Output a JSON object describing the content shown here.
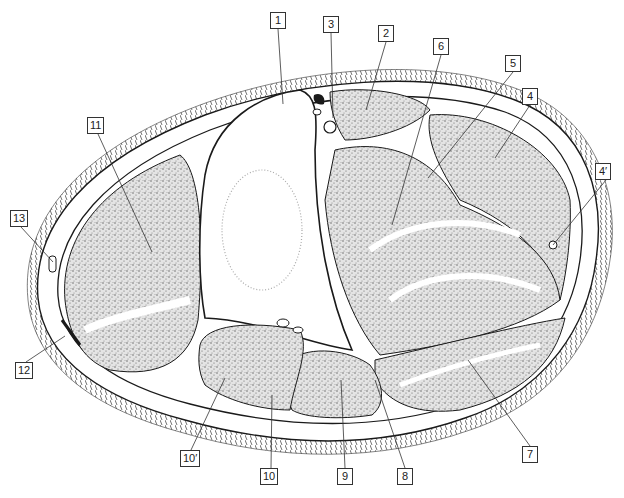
{
  "figure": {
    "type": "anatomical cross-section illustration",
    "colors": {
      "ink": "#1a1a1a",
      "stipple": "#8a8a8a",
      "background": "#ffffff",
      "bone": "#ffffff"
    },
    "labels": [
      {
        "id": "1",
        "text": "1",
        "x": 270,
        "y": 12,
        "tx": 283,
        "ty": 104
      },
      {
        "id": "3",
        "text": "3",
        "x": 323,
        "y": 16,
        "tx": 333,
        "ty": 118
      },
      {
        "id": "2",
        "text": "2",
        "x": 378,
        "y": 25,
        "tx": 366,
        "ty": 110
      },
      {
        "id": "6",
        "text": "6",
        "x": 433,
        "y": 38,
        "tx": 392,
        "ty": 225
      },
      {
        "id": "5",
        "text": "5",
        "x": 505,
        "y": 55,
        "tx": 428,
        "ty": 178
      },
      {
        "id": "4",
        "text": "4",
        "x": 522,
        "y": 88,
        "tx": 495,
        "ty": 158
      },
      {
        "id": "4p",
        "text": "4′",
        "x": 595,
        "y": 163,
        "tx": 553,
        "ty": 245
      },
      {
        "id": "11",
        "text": "11",
        "x": 87,
        "y": 117,
        "tx": 152,
        "ty": 252
      },
      {
        "id": "13",
        "text": "13",
        "x": 10,
        "y": 210,
        "tx": 53,
        "ty": 262
      },
      {
        "id": "12",
        "text": "12",
        "x": 15,
        "y": 362,
        "tx": 65,
        "ty": 336
      },
      {
        "id": "10p",
        "text": "10′",
        "x": 180,
        "y": 450,
        "tx": 225,
        "ty": 378
      },
      {
        "id": "10",
        "text": "10",
        "x": 260,
        "y": 468,
        "tx": 272,
        "ty": 395
      },
      {
        "id": "9",
        "text": "9",
        "x": 337,
        "y": 468,
        "tx": 341,
        "ty": 380
      },
      {
        "id": "8",
        "text": "8",
        "x": 397,
        "y": 468,
        "tx": 375,
        "ty": 380
      },
      {
        "id": "7",
        "text": "7",
        "x": 522,
        "y": 446,
        "tx": 468,
        "ty": 360
      }
    ]
  }
}
